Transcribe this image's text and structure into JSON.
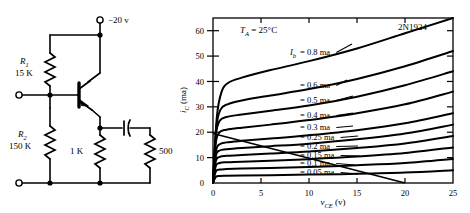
{
  "figure": {
    "title": "",
    "panels": [
      "circuit-schematic",
      "collector-characteristics-chart"
    ]
  },
  "circuit": {
    "supply_label": "−20 v",
    "components": [
      {
        "ref": "R1",
        "ref_sub": "1",
        "ref_base": "R",
        "value": "15 K"
      },
      {
        "ref": "R2",
        "ref_sub": "2",
        "ref_base": "R",
        "value": "150 K"
      },
      {
        "ref": "Re",
        "ref_base": "",
        "value": "1 K"
      },
      {
        "ref": "RL",
        "ref_base": "",
        "value": "500"
      }
    ],
    "r1_base": "R",
    "r1_sub": "1",
    "r1_value": "15 K",
    "r2_base": "R",
    "r2_sub": "2",
    "r2_value": "150 K",
    "emitter_resistor": "1 K",
    "load_resistor": "500",
    "transistor_type": "PNP",
    "terminals": [
      "input-terminal",
      "ground-terminal",
      "supply-terminal"
    ]
  },
  "chart_data": {
    "type": "line",
    "title": "",
    "device": "2N1924",
    "temperature": "Tₐ = 25°C",
    "temp_base": "T",
    "temp_sub": "A",
    "temp_value": "= 25°C",
    "xlabel": "v_CE (v)",
    "xlabel_base": "v",
    "xlabel_sub": "CE",
    "xlabel_unit": "(v)",
    "ylabel": "i_C (ma)",
    "ylabel_base": "i",
    "ylabel_sub": "C",
    "ylabel_unit": "(ma)",
    "xlim": [
      0,
      25
    ],
    "ylim": [
      0,
      65
    ],
    "xticks": [
      "0",
      "5",
      "10",
      "15",
      "20",
      "25"
    ],
    "xtick_values": [
      0,
      5,
      10,
      15,
      20,
      25
    ],
    "yticks": [
      "0",
      "10",
      "20",
      "30",
      "40",
      "50",
      "60"
    ],
    "ytick_values": [
      0,
      10,
      20,
      30,
      40,
      50,
      60
    ],
    "grid": false,
    "legend": "inline-curve-labels",
    "current_symbol_base": "I",
    "current_symbol_sub": "b",
    "series": [
      {
        "name": "= 0.8 ma",
        "ib": 0.8,
        "label": "= 0.8 ma",
        "x": [
          0,
          0.4,
          0.9,
          1.6,
          3,
          6,
          10,
          15,
          20,
          25
        ],
        "values": [
          0,
          26,
          36,
          39.5,
          41.5,
          44.5,
          48,
          53,
          59,
          65
        ]
      },
      {
        "name": "= 0.6 ma",
        "ib": 0.6,
        "label": "= 0.6 ma",
        "x": [
          0,
          0.35,
          0.8,
          1.5,
          3,
          6,
          10,
          15,
          20,
          25
        ],
        "values": [
          0,
          22,
          29,
          31,
          32.5,
          34.5,
          37,
          41,
          46,
          52
        ]
      },
      {
        "name": "= 0.5 ma",
        "ib": 0.5,
        "label": "= 0.5 ma",
        "x": [
          0,
          0.3,
          0.7,
          1.4,
          3,
          6,
          10,
          15,
          20,
          25
        ],
        "values": [
          0,
          19,
          24.5,
          26,
          27,
          28.5,
          30.5,
          34,
          38.5,
          44
        ]
      },
      {
        "name": "= 0.4 ma",
        "ib": 0.4,
        "label": "= 0.4 ma",
        "x": [
          0,
          0.3,
          0.7,
          1.4,
          3,
          6,
          10,
          15,
          20,
          25
        ],
        "values": [
          0,
          16,
          20,
          21,
          21.8,
          23,
          24.8,
          27.5,
          31,
          36
        ]
      },
      {
        "name": "= 0.3 ma",
        "ib": 0.3,
        "label": "= 0.3 ma",
        "x": [
          0,
          0.3,
          0.7,
          1.4,
          3,
          6,
          10,
          15,
          20,
          25
        ],
        "values": [
          0,
          12.5,
          15.3,
          16,
          16.6,
          17.5,
          18.8,
          20.8,
          23.5,
          27.5
        ]
      },
      {
        "name": "= 0.25 ma",
        "ib": 0.25,
        "label": "= 0.25 ma",
        "x": [
          0,
          0.3,
          0.7,
          1.4,
          3,
          6,
          10,
          15,
          20,
          25
        ],
        "values": [
          0,
          10.8,
          12.8,
          13.3,
          13.8,
          14.5,
          15.5,
          17.2,
          19.5,
          23
        ]
      },
      {
        "name": "= 0.2 ma",
        "ib": 0.2,
        "label": "= 0.2 ma",
        "x": [
          0,
          0.3,
          0.7,
          1.4,
          3,
          6,
          10,
          15,
          20,
          25
        ],
        "values": [
          0,
          8.8,
          10.3,
          10.7,
          11,
          11.6,
          12.4,
          13.8,
          15.6,
          18.5
        ]
      },
      {
        "name": "= 0.15 ma",
        "ib": 0.15,
        "label": "= 0.15 ma",
        "x": [
          0,
          0.3,
          0.7,
          1.4,
          3,
          6,
          10,
          15,
          20,
          25
        ],
        "values": [
          0,
          6.8,
          7.9,
          8.2,
          8.4,
          8.8,
          9.4,
          10.4,
          11.8,
          14
        ]
      },
      {
        "name": "= 0.1 ma",
        "ib": 0.1,
        "label": "= 0.1 ma",
        "x": [
          0,
          0.3,
          0.7,
          1.4,
          3,
          6,
          10,
          15,
          20,
          25
        ],
        "values": [
          0,
          4.6,
          5.3,
          5.5,
          5.7,
          5.9,
          6.3,
          7,
          7.9,
          9.5
        ]
      },
      {
        "name": "= 0.05 ma",
        "ib": 0.05,
        "label": "= 0.05 ma",
        "x": [
          0,
          0.3,
          0.7,
          1.4,
          3,
          6,
          10,
          15,
          20,
          25
        ],
        "values": [
          0,
          2.4,
          2.8,
          2.9,
          3,
          3.1,
          3.3,
          3.6,
          4.1,
          5
        ]
      }
    ],
    "loadline": {
      "name": "load-line",
      "x": [
        0,
        20
      ],
      "values": [
        19.5,
        0
      ]
    }
  }
}
